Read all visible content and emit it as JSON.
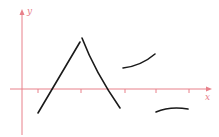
{
  "diagram": {
    "axes": {
      "x_label": "x",
      "y_label": "y",
      "axis_color": "#e8808a",
      "curve_color": "#1a1a1a",
      "x_ticks": 5
    },
    "curves": [
      {
        "name": "rising-segment",
        "description": "increasing line from below x-axis up to peak"
      },
      {
        "name": "falling-segment",
        "description": "decreasing curve from peak down below x-axis"
      },
      {
        "name": "upper-right-arc",
        "description": "increasing concave-down arc above x-axis"
      },
      {
        "name": "lower-right-arc",
        "description": "concave-down arc below x-axis"
      }
    ]
  }
}
